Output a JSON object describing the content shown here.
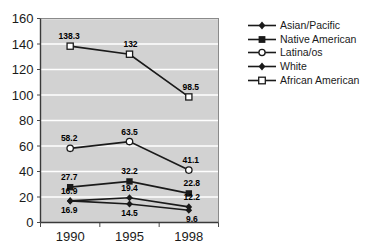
{
  "chart_data": {
    "type": "line",
    "title": "",
    "xlabel": "",
    "ylabel": "",
    "categories": [
      "1990",
      "1995",
      "1998"
    ],
    "ylim": [
      0,
      160
    ],
    "ytick_step": 20,
    "yticks": [
      "0",
      "20",
      "40",
      "60",
      "80",
      "100",
      "120",
      "140",
      "160"
    ],
    "grid": true,
    "legend_position": "right",
    "plot_background": "#d2d2d2",
    "gridline_color": "#ffffff",
    "line_color": "#1a1a1a",
    "series": [
      {
        "name": "Asian/Pacific",
        "marker": "filled-diamond",
        "values": [
          16.9,
          19.4,
          12.2
        ],
        "labels": [
          "16.9",
          "19.4",
          "12.2"
        ]
      },
      {
        "name": "Native American",
        "marker": "filled-square",
        "values": [
          27.7,
          32.2,
          22.8
        ],
        "labels": [
          "27.7",
          "32.2",
          "22.8"
        ]
      },
      {
        "name": "Latina/os",
        "marker": "open-circle",
        "values": [
          58.2,
          63.5,
          41.1
        ],
        "labels": [
          "58.2",
          "63.5",
          "41.1"
        ]
      },
      {
        "name": "White",
        "marker": "filled-diamond",
        "values": [
          16.9,
          14.5,
          9.6
        ],
        "labels": [
          "16.9",
          "14.5",
          "9.6"
        ]
      },
      {
        "name": "African American",
        "marker": "open-square",
        "values": [
          138.3,
          132,
          98.5
        ],
        "labels": [
          "138.3",
          "132",
          "98.5"
        ]
      }
    ]
  },
  "legend": {
    "items": [
      {
        "label": "Asian/Pacific",
        "marker": "filled-diamond"
      },
      {
        "label": "Native American",
        "marker": "filled-square"
      },
      {
        "label": "Latina/os",
        "marker": "open-circle"
      },
      {
        "label": "White",
        "marker": "filled-diamond"
      },
      {
        "label": "African American",
        "marker": "open-square"
      }
    ]
  },
  "axis": {
    "y_labels": [
      "160",
      "140",
      "120",
      "100",
      "80",
      "60",
      "40",
      "20",
      "0"
    ],
    "x_labels": [
      "1990",
      "1995",
      "1998"
    ]
  }
}
